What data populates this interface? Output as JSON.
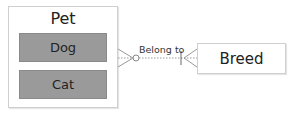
{
  "entities": {
    "pet": {
      "title": "Pet",
      "subtypes": [
        {
          "label": "Dog"
        },
        {
          "label": "Cat"
        }
      ]
    },
    "breed": {
      "title": "Breed"
    }
  },
  "relationship": {
    "label": "Belong to",
    "from": "Pet",
    "to": "Breed",
    "from_cardinality": "zero-or-many",
    "to_cardinality": "one-or-many"
  },
  "colors": {
    "subtype_fill": "#9a9a9a",
    "border": "#cfcfcf",
    "line": "#888888"
  }
}
